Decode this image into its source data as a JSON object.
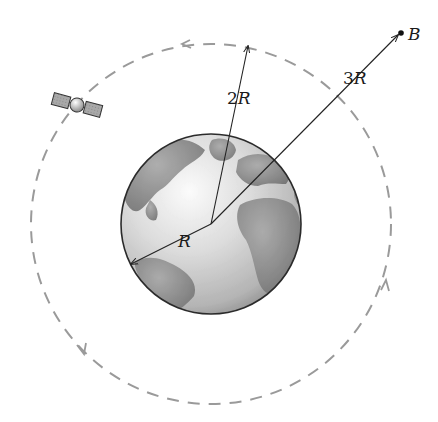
{
  "figure": {
    "labels": {
      "earth_radius": "R",
      "orbit_radius_coef": "2",
      "orbit_radius_var": "R",
      "point_distance_coef": "3",
      "point_distance_var": "R",
      "point": "B"
    },
    "geometry": {
      "earth_center": [
        211,
        224
      ],
      "earth_radius_px": 90,
      "orbit_radius_px": 180,
      "orbit_direction": "counterclockwise"
    },
    "colors": {
      "orbit": "#9a9a9a",
      "lines": "#222222",
      "earth_ocean": "#d9d9d9",
      "earth_land": "#8a8a8a"
    }
  }
}
